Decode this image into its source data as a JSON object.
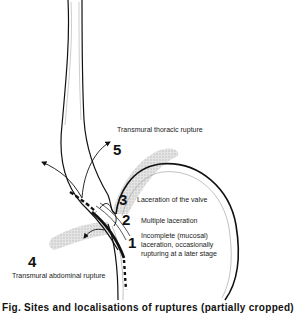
{
  "diagram": {
    "labels": {
      "thoracic": "Transmural thoracic rupture",
      "valve": "Laceration of the valve",
      "multiple": "Multiple laceration",
      "incomplete_1": "Incomplete (mucosal)",
      "incomplete_2": "laceration, occasionally",
      "incomplete_3": "rupturing at a later stage",
      "abdominal": "Transmural abdominal rupture"
    },
    "numbers": {
      "n1": "1",
      "n2": "2",
      "n3": "3",
      "n4": "4",
      "n5": "5"
    },
    "caption": "Fig. Sites and localisations of ruptures (partially cropped)",
    "colors": {
      "line": "#111111",
      "shade": "#c8c8c8",
      "background": "#ffffff"
    }
  }
}
